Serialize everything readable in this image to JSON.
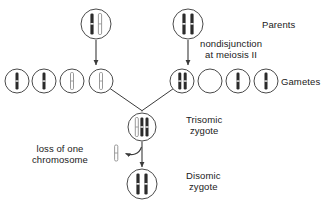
{
  "figure": {
    "background_color": "#ffffff",
    "line_color": "#3a3a3a",
    "chromosome_dark_color": "#2b2b2b",
    "chromosome_light_color": "#9a9a9a",
    "cell_outline_color": "#4a4a4a"
  },
  "labels": {
    "parents": "Parents",
    "nondisjunction_line1": "nondisjunction",
    "nondisjunction_line2": "at meiosis II",
    "gametes": "Gametes",
    "trisomic_line1": "Trisomic",
    "trisomic_line2": "zygote",
    "loss_line1": "loss of one",
    "loss_line2": "chromosome",
    "disomic_line1": "Disomic",
    "disomic_line2": "zygote"
  },
  "cells": {
    "parents": [
      {
        "id": "parent-left",
        "cx": 96,
        "cy": 24,
        "r": 15,
        "chromosomes": [
          "dark",
          "light"
        ]
      },
      {
        "id": "parent-right",
        "cx": 188,
        "cy": 24,
        "r": 15,
        "chromosomes": [
          "dark",
          "dark"
        ]
      }
    ],
    "gametes": [
      {
        "id": "gamete-1",
        "cx": 17,
        "cy": 81,
        "r": 12,
        "chromosomes": [
          "dark"
        ]
      },
      {
        "id": "gamete-2",
        "cx": 44,
        "cy": 81,
        "r": 12,
        "chromosomes": [
          "dark"
        ]
      },
      {
        "id": "gamete-3",
        "cx": 72,
        "cy": 81,
        "r": 12,
        "chromosomes": [
          "light"
        ]
      },
      {
        "id": "gamete-4",
        "cx": 101,
        "cy": 81,
        "r": 12,
        "chromosomes": [
          "light"
        ]
      },
      {
        "id": "gamete-5",
        "cx": 182,
        "cy": 81,
        "r": 12,
        "chromosomes": [
          "dark",
          "dark"
        ]
      },
      {
        "id": "gamete-6",
        "cx": 210,
        "cy": 81,
        "r": 12,
        "chromosomes": []
      },
      {
        "id": "gamete-7",
        "cx": 238,
        "cy": 81,
        "r": 12,
        "chromosomes": [
          "dark"
        ]
      },
      {
        "id": "gamete-8",
        "cx": 266,
        "cy": 81,
        "r": 12,
        "chromosomes": [
          "dark"
        ]
      }
    ],
    "zygotes": [
      {
        "id": "trisomic-zygote",
        "cx": 142,
        "cy": 127,
        "r": 14,
        "chromosomes": [
          "light",
          "dark",
          "dark"
        ]
      },
      {
        "id": "disomic-zygote",
        "cx": 142,
        "cy": 184,
        "r": 15,
        "chromosomes": [
          "dark",
          "dark"
        ]
      }
    ],
    "lost_chromosome": {
      "id": "lost-chromosome",
      "cx": 116,
      "cy": 153,
      "type": "light"
    }
  },
  "connectors": [
    {
      "id": "parent-left-arrow",
      "type": "arrow",
      "x1": 96,
      "y1": 40,
      "x2": 96,
      "y2": 66
    },
    {
      "id": "parent-right-arrow",
      "type": "arrow",
      "x1": 188,
      "y1": 40,
      "x2": 188,
      "y2": 66
    },
    {
      "id": "fusion-line-left",
      "type": "line",
      "x1": 110,
      "y1": 89,
      "x2": 142,
      "y2": 110
    },
    {
      "id": "fusion-line-right",
      "type": "line",
      "x1": 174,
      "y1": 89,
      "x2": 142,
      "y2": 110
    },
    {
      "id": "trisomic-to-disomic",
      "type": "arrow",
      "x1": 142,
      "y1": 142,
      "x2": 142,
      "y2": 167
    },
    {
      "id": "chromosome-loss-arrow",
      "type": "curve",
      "from": [
        140,
        146
      ],
      "to": [
        124,
        153
      ]
    }
  ],
  "label_positions": {
    "parents": {
      "left": 262,
      "top": 19
    },
    "nondisjunction": {
      "left": 200,
      "top": 39
    },
    "gametes": {
      "left": 281,
      "top": 76
    },
    "trisomic": {
      "left": 186,
      "top": 114
    },
    "loss": {
      "left": 34,
      "top": 142
    },
    "disomic": {
      "left": 186,
      "top": 170
    }
  }
}
